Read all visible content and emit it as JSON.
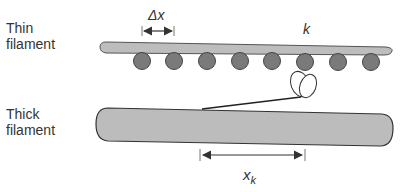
{
  "labels": {
    "thin_line1": "Thin",
    "thin_line2": "filament",
    "thick_line1": "Thick",
    "thick_line2": "filament",
    "delta_x": "Δx",
    "k": "k",
    "x_k_base": "x",
    "x_k_sub": "k"
  },
  "colors": {
    "filament_fill": "#bdbdbd",
    "actin_fill": "#7a7a7a",
    "outline": "#333333"
  },
  "actin_monomers_x": [
    142,
    174,
    207,
    240,
    272,
    305,
    338,
    371
  ]
}
